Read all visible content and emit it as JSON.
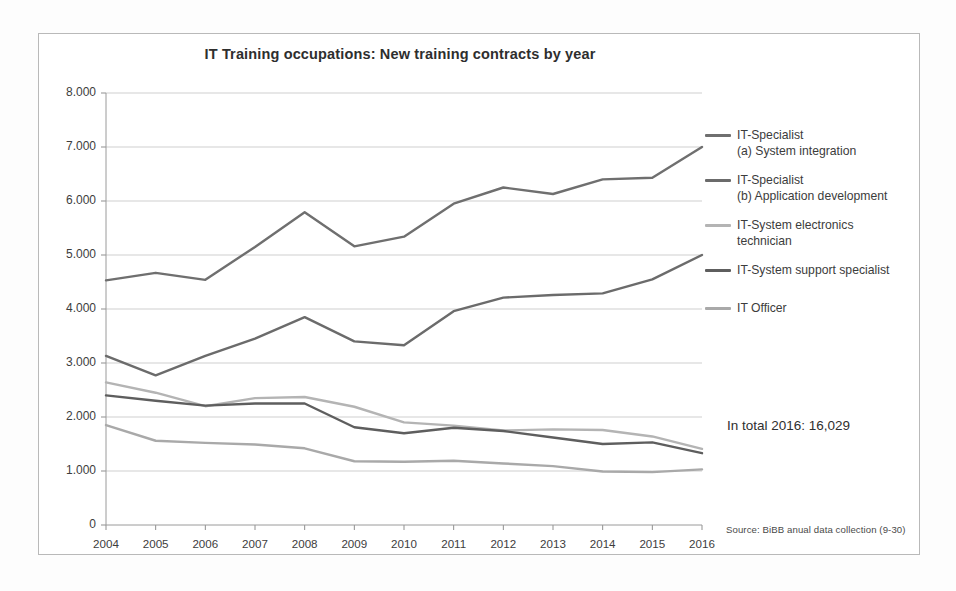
{
  "figure": {
    "title": "IT Training occupations:  New training contracts by year",
    "total_note": "In total 2016: 16,029",
    "source_note": "Source: BiBB anual data collection  (9-30)"
  },
  "legend": {
    "position": "right",
    "items": [
      {
        "label": "IT-Specialist",
        "label2": "(a) System integration",
        "color": "#6f6f6f"
      },
      {
        "label": "IT-Specialist",
        "label2": "(b) Application development",
        "color": "#6b6b6b"
      },
      {
        "label": "IT-System electronics",
        "label2": "technician",
        "color": "#b4b4b4"
      },
      {
        "label": "IT-System support specialist",
        "label2": "",
        "color": "#5e5e5e"
      },
      {
        "label": "IT Officer",
        "label2": "",
        "color": "#a9a9a9"
      }
    ]
  },
  "chart_data": {
    "type": "line",
    "title": "IT Training occupations:  New training contracts by year",
    "xlabel": "",
    "ylabel": "",
    "x": [
      2004,
      2005,
      2006,
      2007,
      2008,
      2009,
      2010,
      2011,
      2012,
      2013,
      2014,
      2015,
      2016
    ],
    "categories": [
      "2004",
      "2005",
      "2006",
      "2007",
      "2008",
      "2009",
      "2010",
      "2011",
      "2012",
      "2013",
      "2014",
      "2015",
      "2016"
    ],
    "ylim": [
      0,
      8000
    ],
    "yticks": [
      0,
      1000,
      2000,
      3000,
      4000,
      5000,
      6000,
      7000,
      8000
    ],
    "ytick_labels": [
      "0",
      "1.000",
      "2.000",
      "3.000",
      "4.000",
      "5.000",
      "6.000",
      "7.000",
      "8.000"
    ],
    "grid": true,
    "legend_position": "right",
    "annotations": [
      {
        "text": "In total 2016: 16,029"
      },
      {
        "text": "Source: BiBB anual data collection  (9-30)"
      }
    ],
    "series": [
      {
        "name": "IT-Specialist (a) System integration",
        "color": "#6f6f6f",
        "values": [
          4530,
          4670,
          4540,
          5150,
          5790,
          5160,
          5340,
          5950,
          6250,
          6130,
          6400,
          6430,
          7000
        ]
      },
      {
        "name": "IT-Specialist (b) Application development",
        "color": "#6b6b6b",
        "values": [
          3130,
          2770,
          3130,
          3450,
          3850,
          3400,
          3330,
          3960,
          4210,
          4260,
          4290,
          4550,
          5000
        ]
      },
      {
        "name": "IT-System electronics technician",
        "color": "#b4b4b4",
        "values": [
          2640,
          2450,
          2200,
          2350,
          2370,
          2190,
          1900,
          1840,
          1750,
          1770,
          1760,
          1640,
          1410
        ]
      },
      {
        "name": "IT-System support specialist",
        "color": "#5e5e5e",
        "values": [
          2400,
          2300,
          2210,
          2250,
          2250,
          1810,
          1700,
          1800,
          1740,
          1620,
          1500,
          1530,
          1330
        ]
      },
      {
        "name": "IT Officer",
        "color": "#a9a9a9",
        "values": [
          1850,
          1560,
          1520,
          1490,
          1420,
          1180,
          1170,
          1190,
          1140,
          1090,
          990,
          980,
          1030
        ]
      }
    ]
  }
}
